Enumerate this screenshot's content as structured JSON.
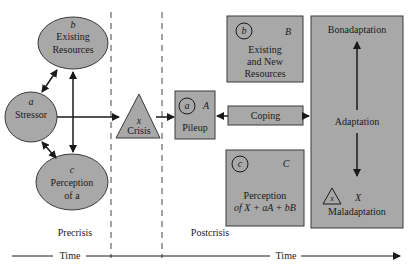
{
  "colors": {
    "shape_fill": "#a8a8a8",
    "shape_stroke": "#3a3a3a",
    "line": "#1a1a1a",
    "background": "#ffffff"
  },
  "precrisis": {
    "stressor": {
      "letter": "a",
      "label": "Stressor"
    },
    "existing_resources": {
      "letter": "b",
      "label_line1": "Existing",
      "label_line2": "Resources"
    },
    "perception": {
      "letter": "c",
      "label_line1": "Perception",
      "label_line2": "of a"
    }
  },
  "crisis": {
    "letter": "x",
    "label": "Crisis"
  },
  "postcrisis": {
    "pileup": {
      "circle_letter": "a",
      "letter": "A",
      "label": "Pileup"
    },
    "resources": {
      "circle_letter": "b",
      "letter": "B",
      "label_line1": "Existing",
      "label_line2": "and New",
      "label_line3": "Resources"
    },
    "coping": {
      "label": "Coping"
    },
    "perception": {
      "circle_letter": "c",
      "letter": "C",
      "label_line1": "Perception",
      "label_line2": "of X + aA + bB"
    }
  },
  "adaptation": {
    "top": "Bonadaptation",
    "middle": "Adaptation",
    "bottom": "Maladaptation",
    "triangle_letter": "x",
    "letter": "X"
  },
  "phases": {
    "precrisis": "Precrisis",
    "postcrisis": "Postcrisis"
  },
  "timeline": {
    "left_label": "Time",
    "right_label": "Time"
  }
}
